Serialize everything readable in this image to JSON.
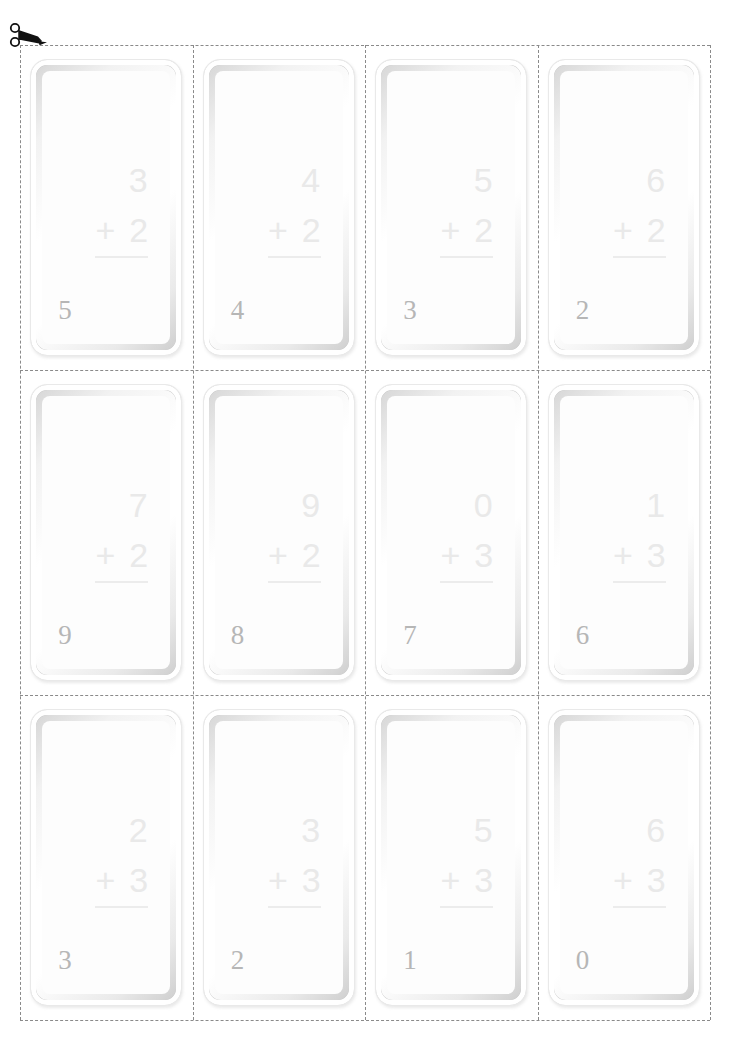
{
  "page": {
    "type": "printable-flashcard-cut-sheet",
    "background_color": "#ffffff",
    "cut_line_color": "#8a8a8a",
    "card_face_color": "#fdfdfd",
    "problem_text_color": "#e9e9e9",
    "corner_number_color": "#b6b6b6"
  },
  "scissors": {
    "icon": "scissors-icon",
    "color": "#111111"
  },
  "grid": {
    "rows": 3,
    "columns": 4,
    "total_cards": 12
  },
  "cards": [
    {
      "addend_top": "3",
      "operator": "+",
      "addend_bottom": "2",
      "corner_number": "5"
    },
    {
      "addend_top": "4",
      "operator": "+",
      "addend_bottom": "2",
      "corner_number": "4"
    },
    {
      "addend_top": "5",
      "operator": "+",
      "addend_bottom": "2",
      "corner_number": "3"
    },
    {
      "addend_top": "6",
      "operator": "+",
      "addend_bottom": "2",
      "corner_number": "2"
    },
    {
      "addend_top": "7",
      "operator": "+",
      "addend_bottom": "2",
      "corner_number": "9"
    },
    {
      "addend_top": "9",
      "operator": "+",
      "addend_bottom": "2",
      "corner_number": "8"
    },
    {
      "addend_top": "0",
      "operator": "+",
      "addend_bottom": "3",
      "corner_number": "7"
    },
    {
      "addend_top": "1",
      "operator": "+",
      "addend_bottom": "3",
      "corner_number": "6"
    },
    {
      "addend_top": "2",
      "operator": "+",
      "addend_bottom": "3",
      "corner_number": "3"
    },
    {
      "addend_top": "3",
      "operator": "+",
      "addend_bottom": "3",
      "corner_number": "2"
    },
    {
      "addend_top": "5",
      "operator": "+",
      "addend_bottom": "3",
      "corner_number": "1"
    },
    {
      "addend_top": "6",
      "operator": "+",
      "addend_bottom": "3",
      "corner_number": "0"
    }
  ]
}
